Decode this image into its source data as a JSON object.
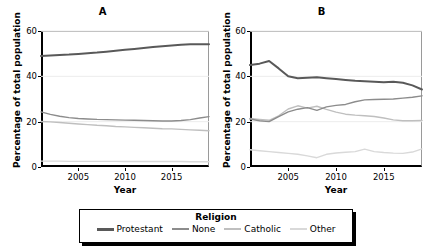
{
  "figure": {
    "legend": {
      "title": "Religion",
      "entries": [
        {
          "label": "Protestant",
          "color": "#595959"
        },
        {
          "label": "None",
          "color": "#8c8c8c"
        },
        {
          "label": "Catholic",
          "color": "#bfbfbf"
        },
        {
          "label": "Other",
          "color": "#d9d9d9"
        }
      ]
    }
  },
  "chart_data": [
    {
      "type": "line",
      "title": "A",
      "xlabel": "Year",
      "ylabel": "Percentage of total population",
      "xlim": [
        2001,
        2019
      ],
      "ylim": [
        0,
        60
      ],
      "yticks": [
        0,
        20,
        40,
        60
      ],
      "xticks": [
        2005,
        2010,
        2015
      ],
      "grid": true,
      "legend_position": "bottom",
      "x": [
        2001,
        2002,
        2003,
        2004,
        2005,
        2006,
        2007,
        2008,
        2009,
        2010,
        2011,
        2012,
        2013,
        2014,
        2015,
        2016,
        2017,
        2018,
        2019
      ],
      "series": [
        {
          "name": "Protestant",
          "color": "#595959",
          "values": [
            49.0,
            49.2,
            49.4,
            49.6,
            49.9,
            50.2,
            50.5,
            50.9,
            51.3,
            51.7,
            52.1,
            52.5,
            52.9,
            53.3,
            53.6,
            53.9,
            54.1,
            54.2,
            54.2
          ]
        },
        {
          "name": "None",
          "color": "#8c8c8c",
          "values": [
            24.3,
            23.2,
            22.4,
            21.8,
            21.4,
            21.2,
            21.0,
            20.9,
            20.8,
            20.7,
            20.6,
            20.5,
            20.4,
            20.3,
            20.3,
            20.5,
            20.9,
            21.6,
            22.2
          ]
        },
        {
          "name": "Catholic",
          "color": "#bfbfbf",
          "values": [
            20.1,
            19.9,
            19.6,
            19.3,
            19.0,
            18.7,
            18.4,
            18.2,
            17.9,
            17.7,
            17.5,
            17.3,
            17.1,
            16.9,
            16.8,
            16.6,
            16.4,
            16.2,
            16.0
          ]
        },
        {
          "name": "Other",
          "color": "#d9d9d9",
          "values": [
            2.6,
            2.6,
            2.6,
            2.5,
            2.5,
            2.5,
            2.5,
            2.5,
            2.5,
            2.4,
            2.4,
            2.4,
            2.4,
            2.4,
            2.4,
            2.4,
            2.3,
            2.3,
            2.3
          ]
        }
      ]
    },
    {
      "type": "line",
      "title": "B",
      "xlabel": "Year",
      "ylabel": "Percentage of total population",
      "xlim": [
        2001,
        2019
      ],
      "ylim": [
        0,
        60
      ],
      "yticks": [
        0,
        20,
        40,
        60
      ],
      "xticks": [
        2005,
        2010,
        2015
      ],
      "grid": true,
      "legend_position": "bottom",
      "x": [
        2001,
        2002,
        2003,
        2004,
        2005,
        2006,
        2007,
        2008,
        2009,
        2010,
        2011,
        2012,
        2013,
        2014,
        2015,
        2016,
        2017,
        2018,
        2019
      ],
      "series": [
        {
          "name": "Protestant",
          "color": "#595959",
          "values": [
            45.0,
            45.6,
            46.8,
            43.5,
            40.0,
            39.2,
            39.4,
            39.6,
            39.2,
            38.8,
            38.4,
            38.0,
            37.8,
            37.6,
            37.4,
            37.6,
            37.2,
            36.0,
            34.2
          ]
        },
        {
          "name": "None",
          "color": "#8c8c8c",
          "values": [
            21.2,
            20.4,
            20.0,
            22.2,
            24.3,
            25.5,
            26.2,
            25.0,
            26.5,
            27.2,
            27.6,
            28.8,
            29.6,
            29.8,
            29.9,
            30.0,
            30.4,
            30.8,
            31.4
          ]
        },
        {
          "name": "Catholic",
          "color": "#bfbfbf",
          "values": [
            21.4,
            21.0,
            20.6,
            22.6,
            25.6,
            27.0,
            26.0,
            26.8,
            25.4,
            24.2,
            23.3,
            22.9,
            22.6,
            22.3,
            21.6,
            20.8,
            20.4,
            20.4,
            20.5
          ]
        },
        {
          "name": "Other",
          "color": "#d9d9d9",
          "values": [
            7.6,
            7.2,
            6.8,
            6.4,
            6.0,
            5.6,
            4.9,
            4.1,
            5.6,
            6.2,
            6.5,
            6.8,
            7.9,
            6.8,
            6.4,
            6.1,
            6.0,
            6.6,
            8.0
          ]
        }
      ]
    }
  ]
}
